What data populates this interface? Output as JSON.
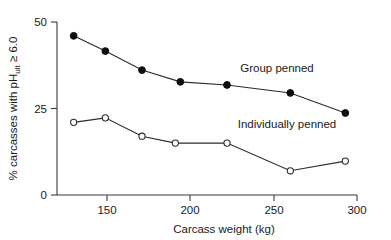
{
  "chart_data": {
    "type": "line",
    "title": "",
    "subtitle": "",
    "xlabel": "Carcass weight (kg)",
    "ylabel": "% carcasses with pH_ult ≥ 6.0",
    "ylabel_parts": {
      "prefix": "% carcasses with pH",
      "subscript": "ult",
      "suffix": " ≥ 6.0"
    },
    "xlim": [
      120,
      300
    ],
    "ylim": [
      0,
      50
    ],
    "xticks": [
      150,
      200,
      250,
      300
    ],
    "xtick_labels": [
      "150",
      "200",
      "250",
      "300"
    ],
    "yticks": [
      0,
      25,
      50
    ],
    "ytick_labels": [
      "0",
      "25",
      "50"
    ],
    "grid": false,
    "legend_position": "inline-annotation",
    "series": [
      {
        "name": "Group penned",
        "marker": "filled-circle",
        "color": "#0d0d0d",
        "x": [
          130,
          149,
          171,
          194,
          222,
          260,
          293
        ],
        "values": [
          46.0,
          41.6,
          36.1,
          32.7,
          31.8,
          29.5,
          23.7
        ]
      },
      {
        "name": "Individually penned",
        "marker": "open-circle",
        "color": "#2b2b2b",
        "x": [
          130,
          149,
          171,
          191,
          222,
          260,
          293
        ],
        "values": [
          21.0,
          22.3,
          17.0,
          15.0,
          15.0,
          7.0,
          9.8
        ]
      }
    ],
    "annotations": [
      {
        "text": "Group penned",
        "x": 252,
        "y": 35.5
      },
      {
        "text": "Individually penned",
        "x": 258,
        "y": 19.5
      }
    ]
  }
}
